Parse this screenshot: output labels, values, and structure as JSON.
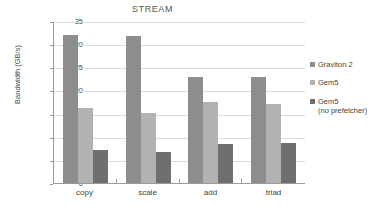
{
  "chart_data": {
    "type": "bar",
    "title": "STREAM",
    "xlabel": "",
    "ylabel": "Bandwidth (GB/s)",
    "categories": [
      "copy",
      "scale",
      "add",
      "triad"
    ],
    "ylim": [
      0,
      35
    ],
    "yticks": [
      0,
      5,
      10,
      15,
      20,
      25,
      30,
      35
    ],
    "grid": true,
    "legend_position": "right",
    "series": [
      {
        "name": "Graviton 2",
        "color": "#8d8d8d",
        "values": [
          32.0,
          31.7,
          22.8,
          22.9
        ]
      },
      {
        "name": "Gem5",
        "color": "#b2b2b2",
        "values": [
          16.1,
          15.1,
          17.5,
          17.0
        ]
      },
      {
        "name": "Gem5\n(no prefetcher)",
        "color": "#6f6f6f",
        "values": [
          7.1,
          6.8,
          8.4,
          8.7
        ]
      }
    ]
  }
}
